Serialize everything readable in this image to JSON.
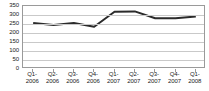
{
  "chart_data": {
    "type": "line",
    "title": "",
    "xlabel": "",
    "ylabel": "",
    "categories": [
      "Q1-2006",
      "Q2-2006",
      "Q3-2006",
      "Q4-2006",
      "Q1-2007",
      "Q2-2007",
      "Q3-2007",
      "Q4-2007",
      "Q1-2008"
    ],
    "category_lines": [
      [
        "Q1-",
        "2006"
      ],
      [
        "Q2-",
        "2006"
      ],
      [
        "Q3-",
        "2006"
      ],
      [
        "Q4-",
        "2006"
      ],
      [
        "Q1-",
        "2007"
      ],
      [
        "Q2-",
        "2007"
      ],
      [
        "Q3-",
        "2007"
      ],
      [
        "Q4-",
        "2007"
      ],
      [
        "Q1-",
        "2008"
      ]
    ],
    "values": [
      255,
      245,
      255,
      235,
      318,
      320,
      282,
      282,
      292
    ],
    "yticks": [
      0,
      50,
      100,
      150,
      200,
      250,
      300,
      350
    ],
    "ytick_labels": [
      "0",
      "50",
      "100",
      "150",
      "200",
      "250",
      "300",
      "350"
    ],
    "ylim": [
      0,
      350
    ],
    "grid": true,
    "legend": "none",
    "series": [
      {
        "name": "series-1",
        "color": "#2b2b2b",
        "values": [
          255,
          245,
          255,
          235,
          318,
          320,
          282,
          282,
          292
        ]
      }
    ],
    "colors": {
      "line": "#2b2b2b",
      "grid": "#c9c9c9",
      "frame": "#9a9a9a",
      "text": "#1a1a1a",
      "background": "#ffffff"
    }
  }
}
